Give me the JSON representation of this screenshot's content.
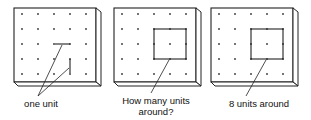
{
  "figure": {
    "boards": [
      {
        "id": "board-1",
        "offset_x": 0,
        "label": "one unit",
        "shape": "unit-segments"
      },
      {
        "id": "board-2",
        "offset_x": 100,
        "label_line1": "How many units",
        "label_line2": "around?",
        "shape": "square-2x2"
      },
      {
        "id": "board-3",
        "offset_x": 197,
        "label": "8 units around",
        "shape": "square-2x2"
      }
    ],
    "grid": {
      "rows": 5,
      "cols": 5
    },
    "colors": {
      "line": "#222222",
      "board": "#ffffff",
      "dot": "#333333"
    }
  }
}
